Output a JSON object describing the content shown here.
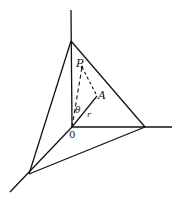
{
  "diagram": {
    "labels": {
      "P": "P",
      "A": "A",
      "O": "0",
      "theta": "θ",
      "r": "r"
    },
    "colors": {
      "line": "#111111",
      "background": "#ffffff"
    }
  }
}
